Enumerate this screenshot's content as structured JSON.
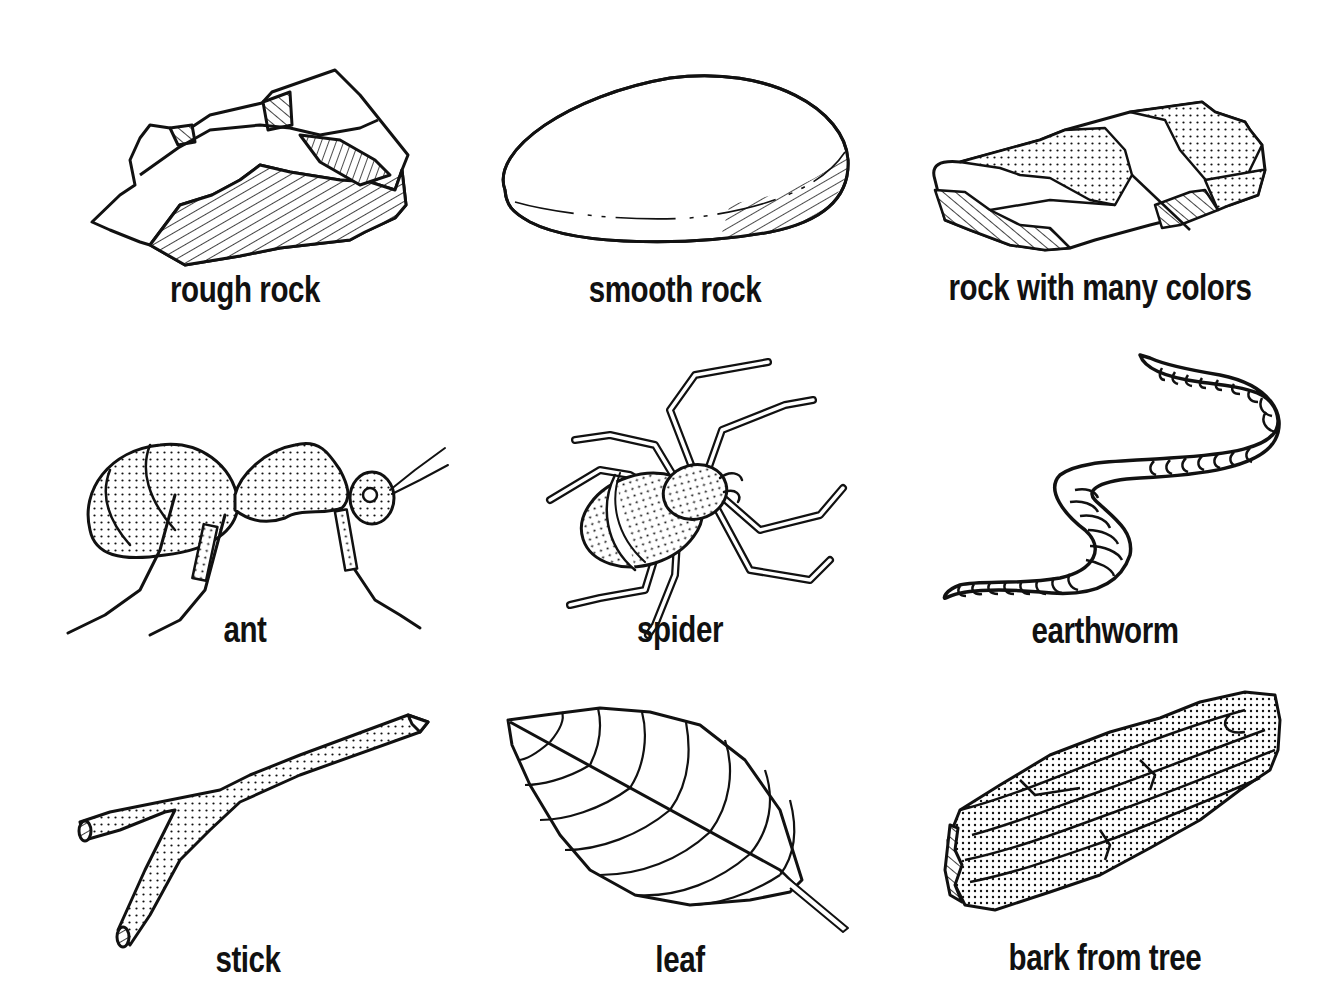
{
  "sheet": {
    "style": "black-and-white line illustrations, 3x3 grid",
    "colors": {
      "ink": "#111111",
      "paper": "#ffffff"
    },
    "items": [
      {
        "id": "rough-rock",
        "label": "rough rock",
        "row": 1,
        "col": 1
      },
      {
        "id": "smooth-rock",
        "label": "smooth rock",
        "row": 1,
        "col": 2
      },
      {
        "id": "rock-many-colors",
        "label": "rock with many colors",
        "row": 1,
        "col": 3
      },
      {
        "id": "ant",
        "label": "ant",
        "row": 2,
        "col": 1
      },
      {
        "id": "spider",
        "label": "spider",
        "row": 2,
        "col": 2
      },
      {
        "id": "earthworm",
        "label": "earthworm",
        "row": 2,
        "col": 3
      },
      {
        "id": "stick",
        "label": "stick",
        "row": 3,
        "col": 1
      },
      {
        "id": "leaf",
        "label": "leaf",
        "row": 3,
        "col": 2
      },
      {
        "id": "bark",
        "label": "bark from tree",
        "row": 3,
        "col": 3
      }
    ]
  }
}
